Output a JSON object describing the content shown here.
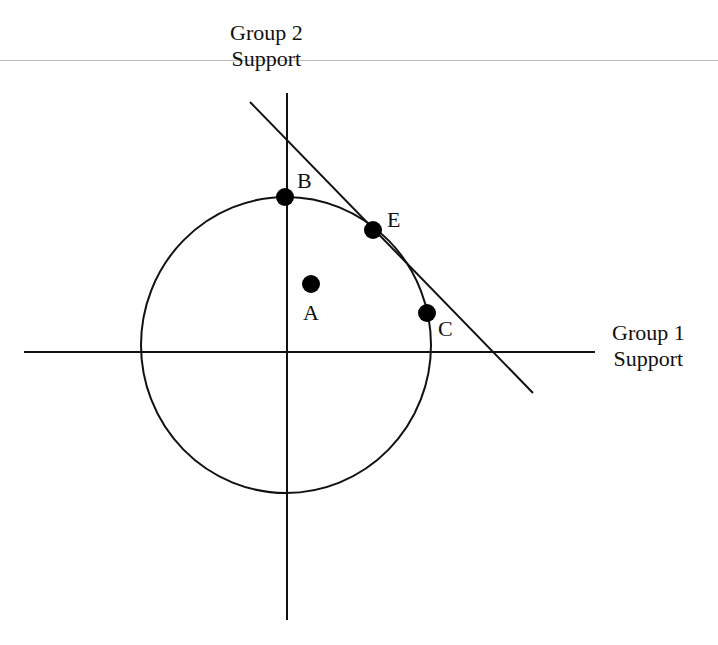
{
  "header": {
    "cut_off_text": "Support for Redistribution"
  },
  "axes": {
    "y_label_line1": "Group 2",
    "y_label_line2": "Support",
    "x_label_line1": "Group 1",
    "x_label_line2": "Support"
  },
  "points": [
    {
      "id": "A",
      "label": "A"
    },
    {
      "id": "B",
      "label": "B"
    },
    {
      "id": "C",
      "label": "C"
    },
    {
      "id": "E",
      "label": "E"
    }
  ],
  "colors": {
    "line": "#111111",
    "point": "#000000",
    "background": "#ffffff"
  }
}
